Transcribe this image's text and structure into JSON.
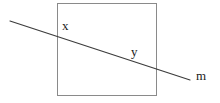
{
  "figure": {
    "background_color": "#ffffff",
    "width": 220,
    "height": 103
  },
  "shapes": {
    "square": {
      "name": "square",
      "x": 57,
      "y": 3,
      "width": 99,
      "height": 93,
      "stroke_color": "#8a8a8a",
      "stroke_width": 1,
      "fill_color": "#ffffff"
    },
    "transversal_line": {
      "name": "transversal-line",
      "x1": 10,
      "y1": 21,
      "x2": 190,
      "y2": 80,
      "stroke_color": "#3c3c3c",
      "stroke_width": 1.2,
      "entry_point": {
        "x": 57,
        "y": 36
      },
      "exit_point": {
        "x": 156,
        "y": 68
      }
    }
  },
  "labels": {
    "x": "x",
    "y": "y",
    "m": "m"
  },
  "colors": {
    "square_stroke": "#8a8a8a",
    "line_stroke": "#3c3c3c",
    "label_text": "#1a1a1a",
    "background": "#ffffff"
  }
}
